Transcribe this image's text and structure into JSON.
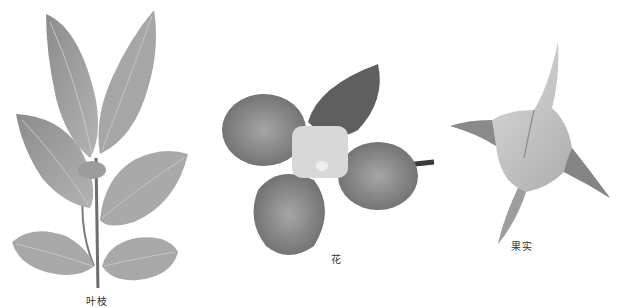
{
  "document": {
    "top_text_fragment": "",
    "figures": [
      {
        "id": "branch",
        "caption": "叶枝",
        "subject": "leafy-branch-photo"
      },
      {
        "id": "flower",
        "caption": "花",
        "subject": "flower-photo"
      },
      {
        "id": "fruit",
        "caption": "果实",
        "subject": "fruit-photo"
      }
    ]
  },
  "colors": {
    "background": "#ffffff",
    "leaf": "#a9a9a9",
    "leaf_dark": "#8a8a8a",
    "stem": "#6e6e6e",
    "petal": "#8f8f8f",
    "petal_dark": "#5e5e5e",
    "flower_center": "#d9d9d9",
    "fruit_light": "#d6d6d6",
    "fruit_dark": "#7a7a7a",
    "caption_text": "#333333"
  }
}
